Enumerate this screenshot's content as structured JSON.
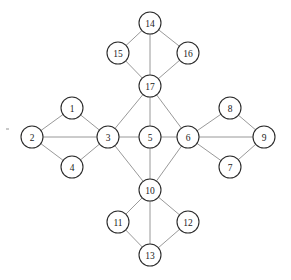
{
  "figure": {
    "kind": "node-link-graph",
    "background_color": "#ffffff",
    "node_fill_color": "#ffffff",
    "node_stroke_color": "#2b2b2b",
    "edge_color": "#8d8d8d",
    "label_color": "#1a1a1a",
    "node_radius": 11
  },
  "chart_data": {
    "type": "diagram",
    "title": "",
    "nodes": [
      {
        "id": 1,
        "label": "1",
        "x": 72,
        "y": 108
      },
      {
        "id": 2,
        "label": "2",
        "x": 32,
        "y": 137
      },
      {
        "id": 3,
        "label": "3",
        "x": 108,
        "y": 137
      },
      {
        "id": 4,
        "label": "4",
        "x": 72,
        "y": 167
      },
      {
        "id": 5,
        "label": "5",
        "x": 150,
        "y": 137
      },
      {
        "id": 6,
        "label": "6",
        "x": 188,
        "y": 137
      },
      {
        "id": 7,
        "label": "7",
        "x": 230,
        "y": 167
      },
      {
        "id": 8,
        "label": "8",
        "x": 230,
        "y": 108
      },
      {
        "id": 9,
        "label": "9",
        "x": 264,
        "y": 137
      },
      {
        "id": 10,
        "label": "10",
        "x": 150,
        "y": 190
      },
      {
        "id": 11,
        "label": "11",
        "x": 118,
        "y": 222
      },
      {
        "id": 12,
        "label": "12",
        "x": 188,
        "y": 222
      },
      {
        "id": 13,
        "label": "13",
        "x": 150,
        "y": 255
      },
      {
        "id": 14,
        "label": "14",
        "x": 150,
        "y": 23
      },
      {
        "id": 15,
        "label": "15",
        "x": 118,
        "y": 53
      },
      {
        "id": 16,
        "label": "16",
        "x": 188,
        "y": 53
      },
      {
        "id": 17,
        "label": "17",
        "x": 150,
        "y": 86
      }
    ],
    "edges": [
      [
        1,
        2
      ],
      [
        1,
        3
      ],
      [
        2,
        3
      ],
      [
        2,
        4
      ],
      [
        3,
        4
      ],
      [
        3,
        5
      ],
      [
        5,
        6
      ],
      [
        6,
        7
      ],
      [
        6,
        8
      ],
      [
        6,
        9
      ],
      [
        7,
        9
      ],
      [
        8,
        9
      ],
      [
        3,
        17
      ],
      [
        5,
        17
      ],
      [
        6,
        17
      ],
      [
        3,
        10
      ],
      [
        5,
        10
      ],
      [
        6,
        10
      ],
      [
        14,
        15
      ],
      [
        14,
        16
      ],
      [
        14,
        17
      ],
      [
        15,
        17
      ],
      [
        16,
        17
      ],
      [
        10,
        11
      ],
      [
        10,
        12
      ],
      [
        10,
        13
      ],
      [
        11,
        13
      ],
      [
        12,
        13
      ]
    ],
    "node_count": 17,
    "edge_count": 28,
    "layout_hint": "four diamonds arranged around a central horizontal chain 3-5-6; hubs 3, 5, 6, 10, 17"
  },
  "artifacts": [
    {
      "name": "speck",
      "x": 6,
      "y": 128,
      "w": 3,
      "h": 2
    }
  ]
}
